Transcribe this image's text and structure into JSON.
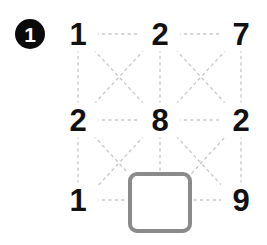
{
  "badge": {
    "label": "1",
    "shape": "filled-circle",
    "background_color": "#0a0a0a",
    "text_color": "#ffffff"
  },
  "puzzle": {
    "type": "number-grid-with-missing-cell",
    "rows": 3,
    "columns": 3,
    "grid": [
      [
        "1",
        "2",
        "7"
      ],
      [
        "2",
        "8",
        "2"
      ],
      [
        "1",
        "",
        "9"
      ]
    ],
    "cells": [
      {
        "id": "r1c1",
        "row": 1,
        "col": 1,
        "value": "1",
        "kind": "number"
      },
      {
        "id": "r1c2",
        "row": 1,
        "col": 2,
        "value": "2",
        "kind": "number"
      },
      {
        "id": "r1c3",
        "row": 1,
        "col": 3,
        "value": "7",
        "kind": "number"
      },
      {
        "id": "r2c1",
        "row": 2,
        "col": 1,
        "value": "2",
        "kind": "number"
      },
      {
        "id": "r2c2",
        "row": 2,
        "col": 2,
        "value": "8",
        "kind": "number"
      },
      {
        "id": "r2c3",
        "row": 2,
        "col": 3,
        "value": "2",
        "kind": "number"
      },
      {
        "id": "r3c1",
        "row": 3,
        "col": 1,
        "value": "1",
        "kind": "number"
      },
      {
        "id": "r3c2",
        "row": 3,
        "col": 2,
        "value": "",
        "kind": "answer-box"
      },
      {
        "id": "r3c3",
        "row": 3,
        "col": 3,
        "value": "9",
        "kind": "number"
      }
    ],
    "answer_box": {
      "value": "",
      "placeholder": "",
      "border_color": "#8a8a8a",
      "fill_color": "#ffffff"
    }
  },
  "connectors": {
    "style": "dotted",
    "color": "#c9c9c9",
    "description": "dotted horizontal, vertical and diagonal links between adjacent grid cells"
  },
  "colors": {
    "number": "#111111",
    "badge": "#0a0a0a",
    "connector": "#c9c9c9",
    "box_border": "#8a8a8a",
    "background": "#ffffff"
  }
}
